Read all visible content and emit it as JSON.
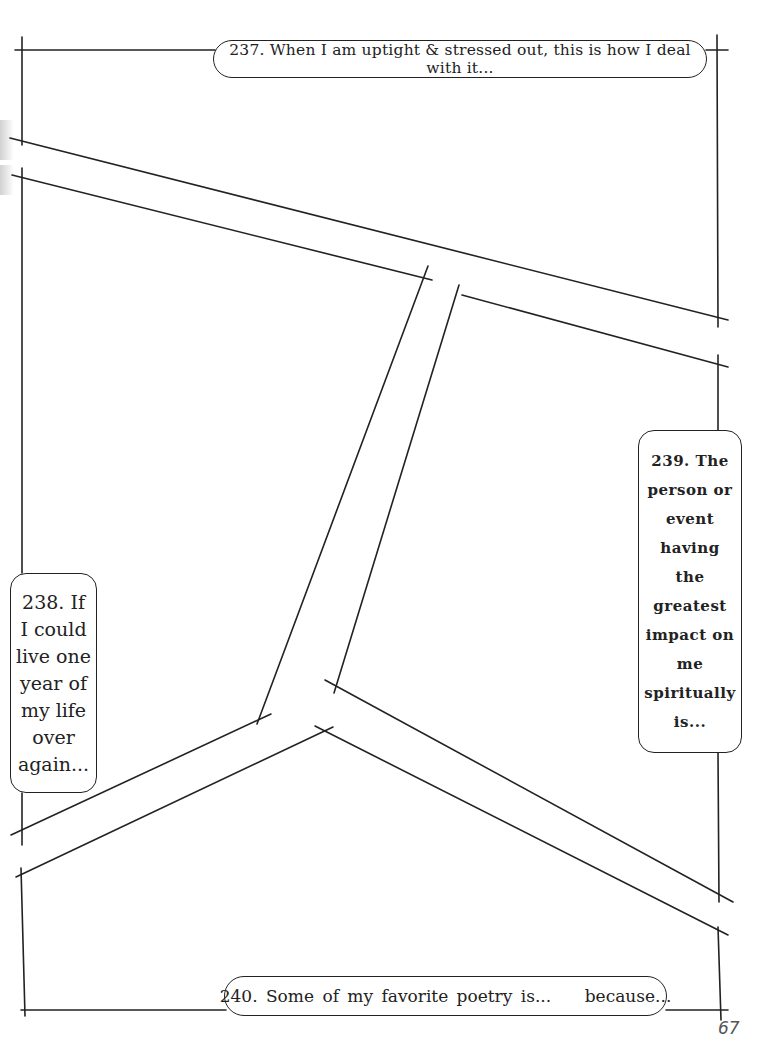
{
  "page": {
    "page_number": "67",
    "line_color": "#222222"
  },
  "prompts": {
    "p237": {
      "text": "237. When I am uptight & stressed out, this is how I deal with it..."
    },
    "p238": {
      "lines": [
        "238. If",
        "I could",
        "live one",
        "year of",
        "my life",
        "over",
        "again..."
      ]
    },
    "p239": {
      "lines": [
        "239. The",
        "person or",
        "event",
        "having",
        "the",
        "greatest",
        "impact on",
        "me",
        "spiritually",
        "is..."
      ]
    },
    "p240": {
      "text": "240. Some of my favorite poetry is...    because..."
    }
  }
}
